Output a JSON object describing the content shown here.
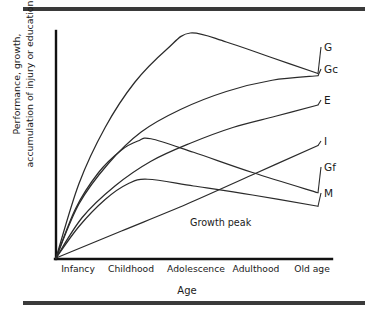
{
  "chart_data": {
    "type": "line",
    "title": "",
    "xlabel": "Age",
    "ylabel_line1": "Performance, growth,",
    "ylabel_line2": "accumulation of injury or education",
    "categories": [
      "Infancy",
      "Childhood",
      "Adolescence",
      "Adulthood",
      "Old age"
    ],
    "x": [
      0,
      1,
      2,
      3,
      4
    ],
    "xlim": [
      0,
      4
    ],
    "ylim": [
      0,
      100
    ],
    "grid": false,
    "legend_position": "right-inline-labels",
    "annotations": [
      {
        "text": "Growth peak",
        "x": 2.1,
        "y": 14
      }
    ],
    "series": [
      {
        "name": "G",
        "label": "G",
        "description": "General ability: rises steeply, peaks in adolescence, then declines slowly",
        "points": [
          {
            "x": 0.0,
            "y": 0
          },
          {
            "x": 0.35,
            "y": 33
          },
          {
            "x": 0.75,
            "y": 58
          },
          {
            "x": 1.2,
            "y": 78
          },
          {
            "x": 1.7,
            "y": 93
          },
          {
            "x": 2.05,
            "y": 100
          },
          {
            "x": 2.6,
            "y": 96
          },
          {
            "x": 3.3,
            "y": 89
          },
          {
            "x": 4.0,
            "y": 82
          }
        ]
      },
      {
        "name": "Gc",
        "label": "Gc",
        "description": "Crystallised intelligence: rises and plateaus high through old age",
        "points": [
          {
            "x": 0.0,
            "y": 0
          },
          {
            "x": 0.35,
            "y": 24
          },
          {
            "x": 0.8,
            "y": 42
          },
          {
            "x": 1.3,
            "y": 56
          },
          {
            "x": 1.9,
            "y": 66
          },
          {
            "x": 2.6,
            "y": 74
          },
          {
            "x": 3.3,
            "y": 79
          },
          {
            "x": 4.0,
            "y": 81
          }
        ]
      },
      {
        "name": "E",
        "label": "E",
        "description": "Education/experience: rises steadily and continues rising into old age",
        "points": [
          {
            "x": 0.0,
            "y": 0
          },
          {
            "x": 0.4,
            "y": 18
          },
          {
            "x": 0.9,
            "y": 32
          },
          {
            "x": 1.45,
            "y": 43
          },
          {
            "x": 2.05,
            "y": 51
          },
          {
            "x": 2.7,
            "y": 58
          },
          {
            "x": 3.35,
            "y": 63
          },
          {
            "x": 4.0,
            "y": 68
          }
        ]
      },
      {
        "name": "Gf",
        "label": "Gf",
        "description": "Fluid intelligence: early rise, peaks in childhood/adolescence, steady decline",
        "points": [
          {
            "x": 0.0,
            "y": 0
          },
          {
            "x": 0.3,
            "y": 22
          },
          {
            "x": 0.65,
            "y": 38
          },
          {
            "x": 1.0,
            "y": 48
          },
          {
            "x": 1.25,
            "y": 52
          },
          {
            "x": 1.45,
            "y": 53
          },
          {
            "x": 2.1,
            "y": 47
          },
          {
            "x": 3.0,
            "y": 38
          },
          {
            "x": 4.0,
            "y": 29
          }
        ]
      },
      {
        "name": "M",
        "label": "M",
        "description": "Maturation: rises early, plateaus in childhood, then slowly declines",
        "points": [
          {
            "x": 0.0,
            "y": 0
          },
          {
            "x": 0.35,
            "y": 14
          },
          {
            "x": 0.75,
            "y": 26
          },
          {
            "x": 1.1,
            "y": 33
          },
          {
            "x": 1.4,
            "y": 35
          },
          {
            "x": 2.1,
            "y": 32
          },
          {
            "x": 3.0,
            "y": 28
          },
          {
            "x": 4.0,
            "y": 23
          }
        ]
      },
      {
        "name": "I",
        "label": "I",
        "description": "Injury/insult accumulation: near-linear increase across the lifespan",
        "points": [
          {
            "x": 0.0,
            "y": 0
          },
          {
            "x": 1.0,
            "y": 12
          },
          {
            "x": 2.0,
            "y": 24
          },
          {
            "x": 3.0,
            "y": 37
          },
          {
            "x": 4.0,
            "y": 50
          }
        ]
      }
    ],
    "series_label_positions": [
      {
        "name": "G",
        "top": 42
      },
      {
        "name": "Gc",
        "top": 64
      },
      {
        "name": "E",
        "top": 95
      },
      {
        "name": "I",
        "top": 136
      },
      {
        "name": "Gf",
        "top": 162
      },
      {
        "name": "M",
        "top": 188
      }
    ]
  },
  "colors": {
    "line": "#2b2b2b",
    "axis": "#111111",
    "rule": "#3a3a3a",
    "text": "#1a1a1a",
    "background": "#ffffff"
  }
}
